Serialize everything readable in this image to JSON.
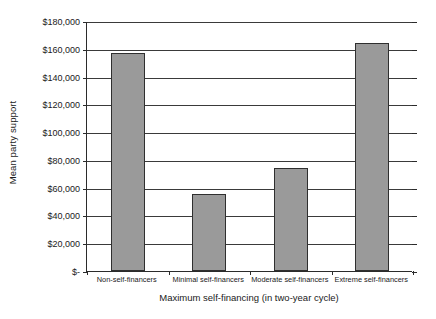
{
  "chart_data": {
    "type": "bar",
    "title": "",
    "xlabel": "Maximum self-financing (in two-year cycle)",
    "ylabel": "Mean party support",
    "categories": [
      "Non-self-financers",
      "Minimal self-financers",
      "Moderate self-financers",
      "Extreme self-financers"
    ],
    "values": [
      157000,
      55400,
      74200,
      164000
    ],
    "ylim": [
      0,
      180000
    ],
    "ytick_values": [
      0,
      20000,
      40000,
      60000,
      80000,
      100000,
      120000,
      140000,
      160000,
      180000
    ],
    "ytick_labels": [
      "$-",
      "$20,000",
      "$40,000",
      "$60,000",
      "$80,000",
      "$100,000",
      "$120,000",
      "$140,000",
      "$160,000",
      "$180,000"
    ],
    "grid": true,
    "legend": false,
    "bar_color": "#9a9a9a",
    "bar_border_color": "#2f2f2f",
    "axis_color": "#2b2b2b",
    "gridline_color": "#3a3a3a"
  }
}
